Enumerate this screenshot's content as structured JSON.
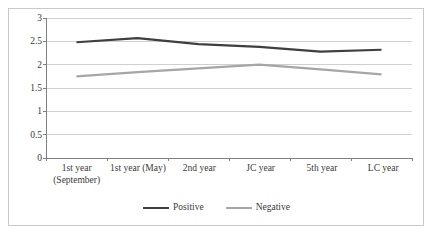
{
  "chart_data": {
    "type": "line",
    "title": "",
    "subtitle": "",
    "xlabel": "",
    "ylabel": "",
    "categories": [
      "1st year\n(September)",
      "1st year (May)",
      "2nd year",
      "JC year",
      "5th year",
      "LC year"
    ],
    "series": [
      {
        "name": "Positive",
        "color": "#3f3f3f",
        "width": 2.2,
        "values": [
          2.48,
          2.57,
          2.44,
          2.38,
          2.28,
          2.32
        ]
      },
      {
        "name": "Negative",
        "color": "#a6a6a6",
        "width": 2.2,
        "values": [
          1.75,
          1.84,
          1.92,
          2.0,
          1.9,
          1.79
        ]
      }
    ],
    "ylim": [
      0,
      3
    ],
    "yticks": [
      "0",
      "0.5",
      "1",
      "1.5",
      "2",
      "2.5",
      "3"
    ],
    "ytick_values": [
      0,
      0.5,
      1,
      1.5,
      2,
      2.5,
      3
    ],
    "grid": true,
    "grid_axis": "y",
    "grid_color": "#d0d0d0",
    "axis_color": "#808080",
    "legend_position": "bottom",
    "frame_color": "#c9c9c9",
    "background": "#ffffff"
  }
}
